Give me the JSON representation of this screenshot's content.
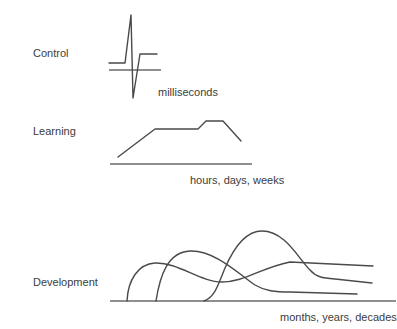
{
  "diagram": {
    "panels": [
      {
        "id": "control",
        "label": "Control",
        "timescale": "milliseconds",
        "shape": "biphasic spike"
      },
      {
        "id": "learning",
        "label": "Learning",
        "timescale": "hours, days, weeks",
        "shape": "ramp up, plateau, step up, decline"
      },
      {
        "id": "development",
        "label": "Development",
        "timescale": "months, years, decades",
        "shape": "three overlapping rise-and-fall curves"
      }
    ]
  },
  "colors": {
    "line": "#4a4a4a",
    "axis": "#6a6a6a",
    "text": "#3c3c3c",
    "background": "#ffffff"
  }
}
